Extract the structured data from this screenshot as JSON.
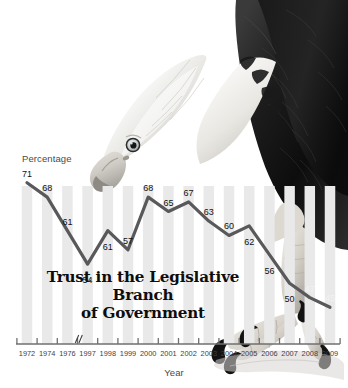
{
  "chart_data": {
    "type": "line",
    "title": "Trust in the Legislative Branch of Government",
    "title_line1": "Trust in the Legislative Branch",
    "title_line2": "of Government",
    "xlabel": "Year",
    "ylabel": "Percentage",
    "categories": [
      "1972",
      "1974",
      "1976",
      "1997",
      "1998",
      "1999",
      "2000",
      "2001",
      "2002",
      "2003",
      "2004",
      "2005",
      "2006",
      "2007",
      "2008",
      "2009"
    ],
    "values": [
      71,
      68,
      61,
      54,
      61,
      57,
      68,
      65,
      67,
      63,
      60,
      62,
      56,
      50,
      47,
      45
    ],
    "ylim": [
      0,
      80
    ],
    "grid": false,
    "legend": false,
    "axis_break": {
      "after_category": "1976",
      "symbol": "//"
    },
    "series": [
      {
        "name": "Trust in the Legislative Branch of Government",
        "values": [
          71,
          68,
          61,
          54,
          61,
          57,
          68,
          65,
          67,
          63,
          60,
          62,
          56,
          50,
          47,
          45
        ]
      }
    ],
    "colors": {
      "line": "#59595b",
      "bar": "#e9e9e9",
      "axis": "#6f6f6f",
      "label_text": "#1d1d1d",
      "title_text": "#0d0d0d"
    }
  },
  "artwork": {
    "subject": "bald-eagle",
    "description": "Grayscale photograph of a bald eagle, head lowered from top-right, talons gripping at lower right"
  }
}
